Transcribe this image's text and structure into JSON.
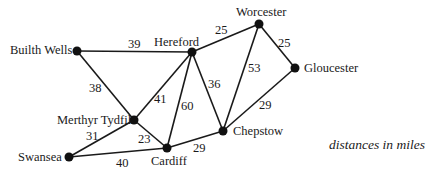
{
  "nodes": {
    "builth_wells": {
      "label": "Builth Wells"
    },
    "hereford": {
      "label": "Hereford"
    },
    "worcester": {
      "label": "Worcester"
    },
    "gloucester": {
      "label": "Gloucester"
    },
    "merthyr_tydfil": {
      "label": "Merthyr Tydfil"
    },
    "chepstow": {
      "label": "Chepstow"
    },
    "cardiff": {
      "label": "Cardiff"
    },
    "swansea": {
      "label": "Swansea"
    }
  },
  "edges": {
    "builth_hereford": {
      "from": "Builth Wells",
      "to": "Hereford",
      "weight": "39"
    },
    "hereford_worcester": {
      "from": "Hereford",
      "to": "Worcester",
      "weight": "25"
    },
    "worcester_gloucester": {
      "from": "Worcester",
      "to": "Gloucester",
      "weight": "25"
    },
    "worcester_chepstow": {
      "from": "Worcester",
      "to": "Chepstow",
      "weight": "53"
    },
    "hereford_chepstow": {
      "from": "Hereford",
      "to": "Chepstow",
      "weight": "36"
    },
    "gloucester_chepstow": {
      "from": "Gloucester",
      "to": "Chepstow",
      "weight": "29"
    },
    "builth_merthyr": {
      "from": "Builth Wells",
      "to": "Merthyr Tydfil",
      "weight": "38"
    },
    "hereford_merthyr": {
      "from": "Hereford",
      "to": "Merthyr Tydfil",
      "weight": "41"
    },
    "hereford_cardiff": {
      "from": "Hereford",
      "to": "Cardiff",
      "weight": "60"
    },
    "merthyr_swansea": {
      "from": "Merthyr Tydfil",
      "to": "Swansea",
      "weight": "31"
    },
    "merthyr_cardiff": {
      "from": "Merthyr Tydfil",
      "to": "Cardiff",
      "weight": "23"
    },
    "swansea_cardiff": {
      "from": "Swansea",
      "to": "Cardiff",
      "weight": "40"
    },
    "cardiff_chepstow": {
      "from": "Cardiff",
      "to": "Chepstow",
      "weight": "29"
    }
  },
  "note": "distances in miles",
  "colors": {
    "line": "#1a1a1a",
    "node": "#111111",
    "background": "#ffffff"
  }
}
